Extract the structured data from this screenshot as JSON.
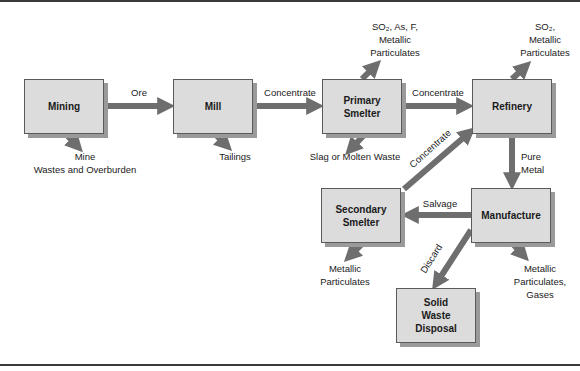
{
  "diagram": {
    "nodes": [
      {
        "id": "mining",
        "label": "Mining"
      },
      {
        "id": "mill",
        "label": "Mill"
      },
      {
        "id": "primary_smelter",
        "label": "Primary\nSmelter"
      },
      {
        "id": "refinery",
        "label": "Refinery"
      },
      {
        "id": "secondary_smelter",
        "label": "Secondary\nSmelter"
      },
      {
        "id": "manufacture",
        "label": "Manufacture"
      },
      {
        "id": "solid_waste",
        "label": "Solid\nWaste\nDisposal"
      }
    ],
    "edges": [
      {
        "from": "mining",
        "to": "mill",
        "label": "Ore"
      },
      {
        "from": "mill",
        "to": "primary_smelter",
        "label": "Concentrate"
      },
      {
        "from": "primary_smelter",
        "to": "refinery",
        "label": "Concentrate"
      },
      {
        "from": "refinery",
        "to": "manufacture",
        "label": "Pure\nMetal"
      },
      {
        "from": "manufacture",
        "to": "secondary_smelter",
        "label": "Salvage"
      },
      {
        "from": "secondary_smelter",
        "to": "refinery",
        "label": "Concentrate"
      },
      {
        "from": "manufacture",
        "to": "solid_waste",
        "label": "Discard"
      }
    ],
    "outputs": {
      "mining": "Mine\nWastes and Overburden",
      "mill": "Tailings",
      "primary_smelter_up": "SO₂, As, F,\nMetallic\nParticulates",
      "primary_smelter_down": "Slag or Molten Waste",
      "refinery_up": "SO₂,\nMetallic\nParticulates",
      "secondary_smelter": "Metallic\nParticulates",
      "manufacture": "Metallic\nParticulates,\nGases"
    },
    "colors": {
      "box_fill": "#dcdcdc",
      "box_shadow": "#9a9a9a",
      "arrow": "#6e6e6e",
      "text": "#1a1a1a"
    }
  }
}
